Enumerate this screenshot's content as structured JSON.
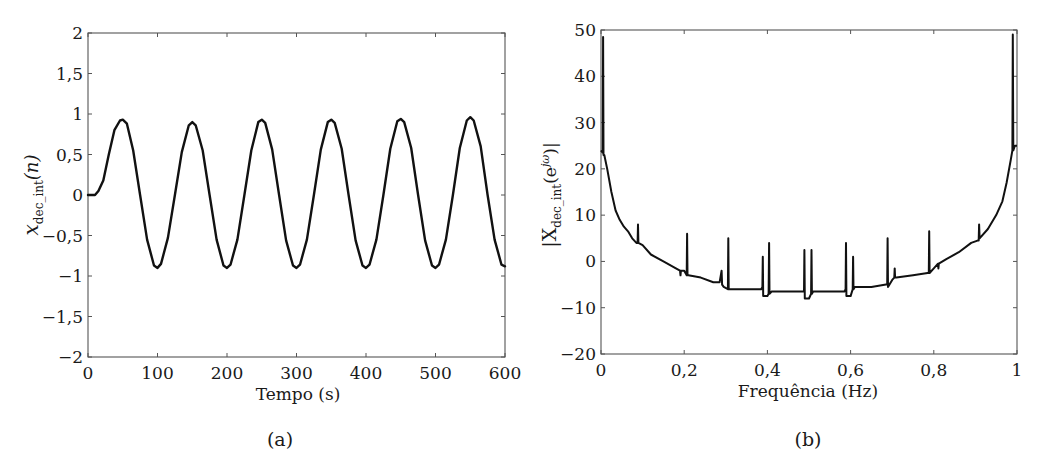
{
  "chart_data": [
    {
      "id": "a",
      "type": "line",
      "caption": "(a)",
      "title": "",
      "xlabel": "Tempo (s)",
      "ylabel_main": "x",
      "ylabel_sub": "dec_int",
      "ylabel_arg": "(n)",
      "xlim": [
        0,
        600
      ],
      "ylim": [
        -2,
        2
      ],
      "grid": false,
      "xticks": [
        0,
        100,
        200,
        300,
        400,
        500,
        600
      ],
      "xtick_labels": [
        "0",
        "100",
        "200",
        "300",
        "400",
        "500",
        "600"
      ],
      "yticks": [
        2,
        1.5,
        1,
        0.5,
        0,
        -0.5,
        -1,
        -1.5,
        -2
      ],
      "ytick_labels": [
        "2",
        "1,5",
        "1",
        "0,5",
        "0",
        "−0,5",
        "−1",
        "−1,5",
        "−2"
      ],
      "series": [
        {
          "name": "x_dec_int(n)",
          "description": "Sinusoid, period ~100 s, amplitude ~0.9-0.95, flat 0 for first ~10 s then rising",
          "x": [
            0,
            10,
            15,
            22,
            30,
            38,
            46,
            50,
            56,
            65,
            75,
            85,
            95,
            100,
            105,
            115,
            125,
            135,
            145,
            150,
            155,
            165,
            175,
            185,
            195,
            200,
            205,
            215,
            225,
            235,
            245,
            250,
            255,
            265,
            275,
            285,
            295,
            300,
            305,
            315,
            325,
            335,
            345,
            350,
            355,
            365,
            375,
            385,
            395,
            400,
            405,
            415,
            425,
            435,
            445,
            450,
            455,
            465,
            475,
            485,
            495,
            500,
            505,
            515,
            525,
            535,
            545,
            550,
            555,
            565,
            575,
            585,
            595,
            600
          ],
          "y": [
            0,
            0,
            0.05,
            0.18,
            0.5,
            0.8,
            0.92,
            0.93,
            0.88,
            0.55,
            0.0,
            -0.55,
            -0.87,
            -0.9,
            -0.85,
            -0.53,
            0.0,
            0.53,
            0.86,
            0.9,
            0.86,
            0.55,
            0.0,
            -0.55,
            -0.87,
            -0.9,
            -0.86,
            -0.55,
            0.0,
            0.55,
            0.9,
            0.93,
            0.89,
            0.56,
            0.0,
            -0.56,
            -0.87,
            -0.9,
            -0.86,
            -0.55,
            0.0,
            0.56,
            0.9,
            0.93,
            0.89,
            0.57,
            0.0,
            -0.56,
            -0.87,
            -0.9,
            -0.86,
            -0.55,
            0.0,
            0.57,
            0.91,
            0.94,
            0.9,
            0.58,
            0.0,
            -0.56,
            -0.87,
            -0.9,
            -0.86,
            -0.55,
            0.0,
            0.58,
            0.92,
            0.96,
            0.92,
            0.6,
            0.0,
            -0.55,
            -0.86,
            -0.88
          ]
        }
      ]
    },
    {
      "id": "b",
      "type": "line",
      "caption": "(b)",
      "title": "",
      "xlabel": "Frequência (Hz)",
      "ylabel_main": "|X",
      "ylabel_sub": "dec_int",
      "ylabel_arg": "(e",
      "ylabel_sup": "jω",
      "ylabel_end": ")|",
      "xlim": [
        0,
        1
      ],
      "ylim": [
        -20,
        50
      ],
      "grid": false,
      "xticks": [
        0,
        0.2,
        0.4,
        0.6,
        0.8,
        1
      ],
      "xtick_labels": [
        "0",
        "0,2",
        "0,4",
        "0,6",
        "0,8",
        "1"
      ],
      "yticks": [
        50,
        40,
        30,
        20,
        10,
        0,
        -10,
        -20
      ],
      "ytick_labels": [
        "50",
        "40",
        "30",
        "20",
        "10",
        "0",
        "−10",
        "−20"
      ],
      "series": [
        {
          "name": "|X_dec_int(e^jw)|",
          "description": "U-shaped magnitude spectrum, ~24 at edges with peaks ~48-49 at f~0.005 and f~0.99, floor ~-6.5 near 0.5, with narrow spikes at ~0.09, 0.21, 0.29, 0.31, 0.39, 0.41, 0.49, 0.51, 0.59, 0.61, 0.69, 0.71, 0.79, 0.91",
          "x": [
            0,
            0.004,
            0.005,
            0.006,
            0.008,
            0.015,
            0.025,
            0.035,
            0.045,
            0.055,
            0.065,
            0.075,
            0.085,
            0.088,
            0.089,
            0.09,
            0.1,
            0.12,
            0.15,
            0.18,
            0.19,
            0.191,
            0.192,
            0.2,
            0.206,
            0.207,
            0.208,
            0.21,
            0.24,
            0.27,
            0.285,
            0.29,
            0.291,
            0.295,
            0.305,
            0.306,
            0.307,
            0.31,
            0.35,
            0.385,
            0.388,
            0.389,
            0.39,
            0.4,
            0.403,
            0.404,
            0.405,
            0.41,
            0.45,
            0.485,
            0.488,
            0.489,
            0.49,
            0.5,
            0.505,
            0.506,
            0.507,
            0.51,
            0.55,
            0.585,
            0.588,
            0.589,
            0.59,
            0.6,
            0.605,
            0.606,
            0.607,
            0.61,
            0.65,
            0.685,
            0.688,
            0.689,
            0.69,
            0.7,
            0.705,
            0.706,
            0.707,
            0.71,
            0.75,
            0.785,
            0.788,
            0.789,
            0.79,
            0.8,
            0.81,
            0.811,
            0.812,
            0.83,
            0.86,
            0.89,
            0.905,
            0.908,
            0.909,
            0.91,
            0.93,
            0.95,
            0.965,
            0.975,
            0.985,
            0.989,
            0.99,
            0.991,
            0.995,
            1.0
          ],
          "y": [
            24,
            23.5,
            48.5,
            23,
            23,
            20,
            15,
            11,
            9,
            7.5,
            6.5,
            5,
            4,
            4,
            8,
            4,
            3.5,
            1.5,
            0,
            -1.5,
            -2,
            -3,
            -2,
            -2,
            -3,
            6,
            -3,
            -3,
            -3.5,
            -4.5,
            -4.5,
            -2,
            -5,
            -5.5,
            -6,
            5,
            -6,
            -6,
            -6,
            -6,
            -5.5,
            1,
            -7.5,
            -7.5,
            -7,
            4,
            -7,
            -6.5,
            -6.5,
            -6.5,
            -6.5,
            2.5,
            -8,
            -8,
            -7,
            2.5,
            -7,
            -6.5,
            -6.5,
            -6.5,
            -6,
            4,
            -7.5,
            -7.5,
            -6,
            1,
            -6,
            -5.5,
            -5.5,
            -5,
            -5,
            5,
            -5.5,
            -4,
            -3.5,
            -1.5,
            -3.5,
            -3.5,
            -3,
            -2.5,
            -2.5,
            6.5,
            -2.5,
            -1.5,
            -0.5,
            -1.5,
            -0.5,
            0.5,
            2,
            4,
            4.5,
            4.5,
            8,
            5,
            7,
            10,
            13,
            17,
            22,
            24,
            49,
            24,
            25,
            25
          ]
        }
      ]
    }
  ]
}
